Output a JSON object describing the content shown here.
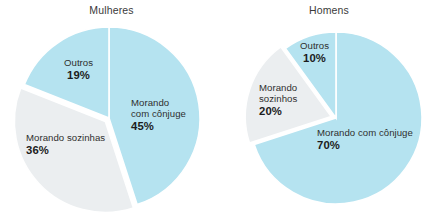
{
  "figure": {
    "background_color": "#ffffff",
    "panels": [
      {
        "id": "mulheres",
        "title": "Mulheres"
      },
      {
        "id": "homens",
        "title": "Homens"
      }
    ]
  },
  "colors": {
    "blue": "#b5e3f0",
    "gray": "#ebeef0",
    "separator": "#ffffff",
    "text": "#2f2f2f",
    "value_text": "#1c1c1c",
    "title_text": "#3a3a3a"
  },
  "chart_data": [
    {
      "type": "pie",
      "title": "Mulheres",
      "categories": [
        "Morando com cônjuge",
        "Morando sozinhas",
        "Outros"
      ],
      "values": [
        45,
        36,
        19
      ],
      "value_labels": [
        "45%",
        "36%",
        "19%"
      ],
      "colors": [
        "#b5e3f0",
        "#ebeef0",
        "#b5e3f0"
      ],
      "exploded": [
        false,
        true,
        false
      ],
      "start_angle": 0,
      "direction": "clockwise",
      "units": "percent",
      "legend": "none",
      "labels_position": "inside-and-outside",
      "xlabel": "",
      "ylabel": ""
    },
    {
      "type": "pie",
      "title": "Homens",
      "categories": [
        "Morando com cônjuge",
        "Morando sozinhos",
        "Outros"
      ],
      "values": [
        70,
        20,
        10
      ],
      "value_labels": [
        "70%",
        "20%",
        "10%"
      ],
      "colors": [
        "#b5e3f0",
        "#ebeef0",
        "#b5e3f0"
      ],
      "exploded": [
        false,
        true,
        false
      ],
      "start_angle": 0,
      "direction": "clockwise",
      "units": "percent",
      "legend": "none",
      "labels_position": "inside-and-outside",
      "xlabel": "",
      "ylabel": ""
    }
  ],
  "labels": {
    "mulheres": {
      "conjuge_line1": "Morando",
      "conjuge_line2": "com cônjuge",
      "conjuge_pct": "45%",
      "sozinhas_line1": "Morando sozinhas",
      "sozinhas_pct": "36%",
      "outros_line1": "Outros",
      "outros_pct": "19%"
    },
    "homens": {
      "conjuge_line1": "Morando com cônjuge",
      "conjuge_pct": "70%",
      "sozinhos_line1": "Morando",
      "sozinhos_line2": "sozinhos",
      "sozinhos_pct": "20%",
      "outros_line1": "Outros",
      "outros_pct": "10%"
    }
  }
}
